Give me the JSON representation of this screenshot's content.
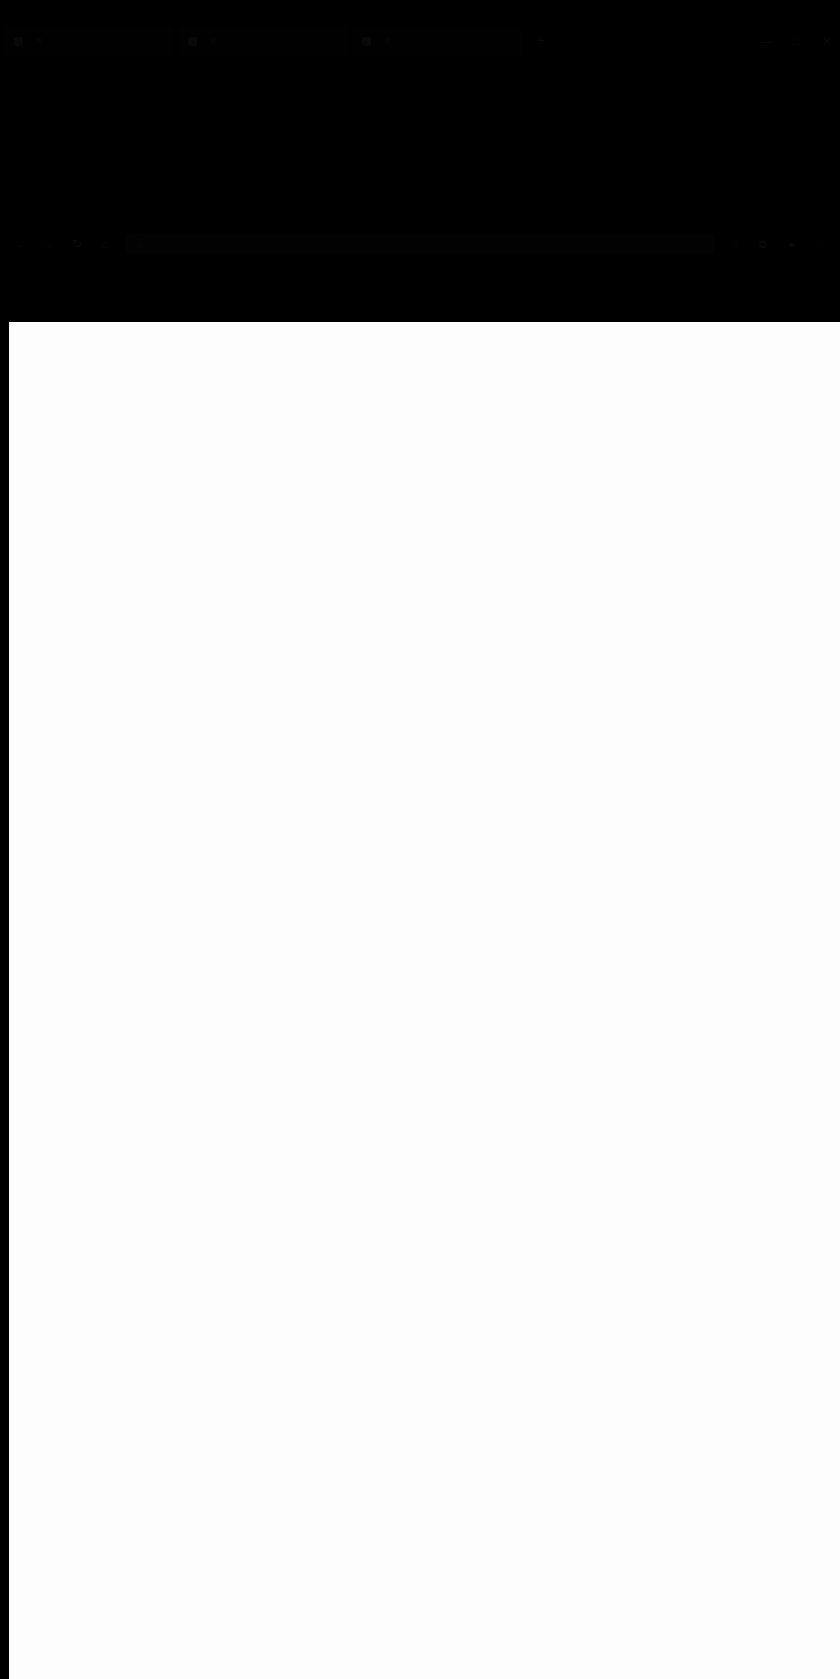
{
  "window": {
    "title": "",
    "controls": [
      {
        "name": "minimize",
        "glyph": "—"
      },
      {
        "name": "maximize",
        "glyph": "□"
      },
      {
        "name": "close",
        "glyph": "✕"
      }
    ]
  },
  "tabs": [
    {
      "label": "",
      "close_glyph": "✕"
    },
    {
      "label": "",
      "close_glyph": "✕"
    },
    {
      "label": "",
      "close_glyph": "✕"
    }
  ],
  "new_tab": {
    "glyph": "+"
  },
  "toolbar": {
    "back_glyph": "←",
    "forward_glyph": "→",
    "reload_glyph": "↻",
    "home_glyph": "⌂",
    "bookmark_glyph": "☆",
    "extensions_glyph": "⧉",
    "profile_glyph": "●",
    "menu_glyph": "⋮"
  },
  "omnibox": {
    "security_glyph": "ⓘ",
    "url": "",
    "placeholder": ""
  },
  "page": {
    "body_text": ""
  }
}
